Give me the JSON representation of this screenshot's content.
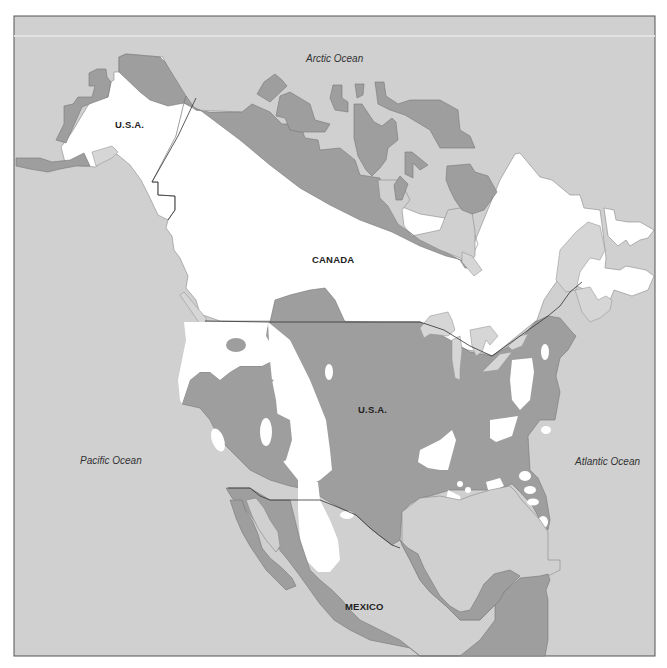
{
  "map": {
    "title": "North America",
    "colors": {
      "ocean": "#d0d0d0",
      "frame": "#555555",
      "unshaded_land": "#ffffff",
      "shaded_land": "#9e9e9e",
      "lakes_islands_light": "#d6d6d6",
      "border_line": "#333333"
    },
    "oceans": {
      "arctic": "Arctic Ocean",
      "pacific": "Pacific Ocean",
      "atlantic": "Atlantic Ocean"
    },
    "countries": {
      "alaska": "U.S.A.",
      "canada": "CANADA",
      "usa": "U.S.A.",
      "mexico": "MEXICO"
    }
  }
}
